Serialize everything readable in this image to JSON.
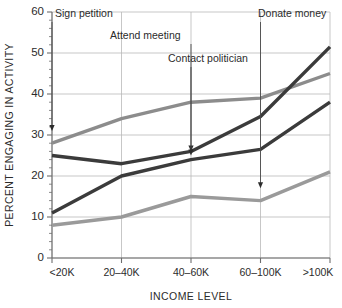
{
  "chart_data": {
    "type": "line",
    "title": "",
    "xlabel": "INCOME LEVEL",
    "ylabel": "PERCENT ENGAGING IN ACTIVITY",
    "categories": [
      "<20K",
      "20–40K",
      "40–60K",
      "60–100K",
      ">100K"
    ],
    "ylim": [
      0,
      60
    ],
    "ytick_labels": [
      "0",
      "10",
      "20",
      "30",
      "40",
      "50",
      "60"
    ],
    "ytick_values": [
      0,
      10,
      20,
      30,
      40,
      50,
      60
    ],
    "yminor_step": 2,
    "grid": "horizontal",
    "legend": "none (inline annotated labels with arrows)",
    "series": [
      {
        "name": "Sign petition",
        "color": "#8c8c8c",
        "values": [
          28,
          34,
          38,
          39,
          45
        ]
      },
      {
        "name": "Attend meeting",
        "color": "#3b3b3b",
        "values": [
          25,
          23,
          26,
          34.5,
          51.5
        ]
      },
      {
        "name": "Contact politician",
        "color": "#3b3b3b",
        "values": [
          11,
          20,
          24,
          26.5,
          38
        ]
      },
      {
        "name": "Donate money",
        "color": "#9a9a9a",
        "values": [
          8,
          10,
          15,
          14,
          21
        ]
      }
    ],
    "annotations": [
      {
        "label": "Sign petition",
        "target_category": "<20K",
        "target_value": 31,
        "label_x": 55,
        "label_y": 17
      },
      {
        "label": "Attend meeting",
        "target_category": "40–60K",
        "target_value": 26,
        "label_x": 110,
        "label_y": 39
      },
      {
        "label": "Contact politician",
        "target_category": "40–60K",
        "target_value": 25,
        "label_x": 168,
        "label_y": 62
      },
      {
        "label": "Donate money",
        "target_category": "60–100K",
        "target_value": 17,
        "label_x": 258,
        "label_y": 17
      }
    ]
  },
  "colors": {
    "background": "#ffffff",
    "grid": "#b9b9b9",
    "axis": "#6d6d6d",
    "text": "#2b2b2b",
    "series_dark": "#3b3b3b",
    "series_gray": "#8c8c8c",
    "series_light": "#9a9a9a"
  }
}
